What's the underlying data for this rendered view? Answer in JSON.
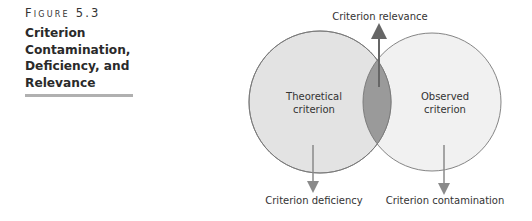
{
  "figure": {
    "label": "Figure 5.3",
    "title_lines": [
      "Criterion",
      "Contamination,",
      "Deficiency, and",
      "Relevance"
    ]
  },
  "diagram": {
    "left_circle": {
      "label_lines": [
        "Theoretical",
        "criterion"
      ],
      "fill": "#e2e2e2"
    },
    "right_circle": {
      "label_lines": [
        "Observed",
        "criterion"
      ],
      "fill": "#f1f1f1"
    },
    "overlap": {
      "fill": "#9a9a9a"
    },
    "outline_color": "#777777",
    "arrows": {
      "relevance": {
        "label": "Criterion relevance",
        "direction": "up",
        "color": "#666666"
      },
      "deficiency": {
        "label": "Criterion deficiency",
        "direction": "down",
        "color": "#8a8a8a"
      },
      "contamination": {
        "label": "Criterion contamination",
        "direction": "down",
        "color": "#8a8a8a"
      }
    }
  },
  "colors": {
    "rule": "#b0b0b0"
  }
}
